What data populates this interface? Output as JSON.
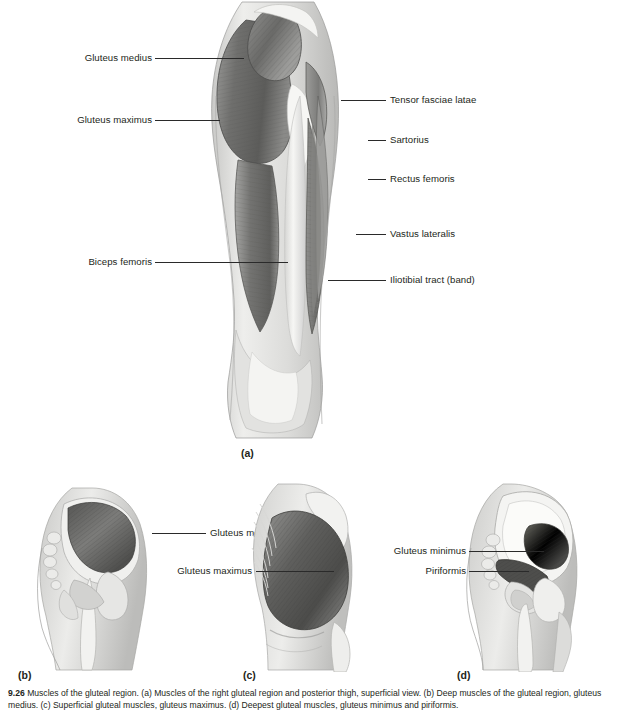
{
  "figure": {
    "caption_number": "9.26",
    "caption_text": "Muscles of the gluteal region. (a) Muscles of the right gluteal region and posterior thigh, superficial view. (b) Deep muscles of the gluteal region, gluteus medius. (c) Superficial gluteal muscles, gluteus maximus. (d) Deepest gluteal muscles, gluteus minimus and piriformis."
  },
  "panels": [
    {
      "id": "a",
      "letter": "(a)",
      "labels": [
        {
          "name": "gluteus-medius",
          "text": "Gluteus medius",
          "side": "left"
        },
        {
          "name": "gluteus-maximus",
          "text": "Gluteus maximus",
          "side": "left"
        },
        {
          "name": "biceps-femoris",
          "text": "Biceps femoris",
          "side": "left"
        },
        {
          "name": "tensor-fasciae-latae",
          "text": "Tensor fasciae latae",
          "side": "right"
        },
        {
          "name": "sartorius",
          "text": "Sartorius",
          "side": "right"
        },
        {
          "name": "rectus-femoris",
          "text": "Rectus femoris",
          "side": "right"
        },
        {
          "name": "vastus-lateralis",
          "text": "Vastus lateralis",
          "side": "right"
        },
        {
          "name": "iliotibial-tract",
          "text": "Iliotibial tract (band)",
          "side": "right"
        }
      ]
    },
    {
      "id": "b",
      "letter": "(b)",
      "labels": [
        {
          "name": "gluteus-medius",
          "text": "Gluteus medius",
          "side": "right"
        }
      ]
    },
    {
      "id": "c",
      "letter": "(c)",
      "labels": [
        {
          "name": "gluteus-maximus",
          "text": "Gluteus maximus",
          "side": "left"
        }
      ]
    },
    {
      "id": "d",
      "letter": "(d)",
      "labels": [
        {
          "name": "gluteus-minimus",
          "text": "Gluteus minimus",
          "side": "left"
        },
        {
          "name": "piriformis",
          "text": "Piriformis",
          "side": "left"
        }
      ]
    }
  ],
  "colors": {
    "background": "#ffffff",
    "text": "#231f20",
    "leader_line": "#2a2a2a",
    "muscle_dark": "#6b6b6b",
    "muscle_mid": "#8e8e8e",
    "muscle_light": "#b8b8b8",
    "tendon": "#f2f2f0",
    "skin": "#d8d8d6",
    "bone": "#efefec"
  }
}
